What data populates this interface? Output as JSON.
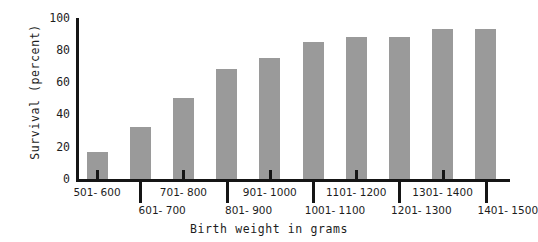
{
  "chart_data": {
    "type": "bar",
    "title": "",
    "xlabel": "Birth weight in grams",
    "ylabel": "Survival (percent)",
    "categories": [
      "501- 600",
      "601- 700",
      "701- 800",
      "801- 900",
      "901- 1000",
      "1001- 1100",
      "1101- 1200",
      "1201- 1300",
      "1301- 1400",
      "1401- 1500"
    ],
    "values": [
      17,
      32,
      50,
      68,
      75,
      85,
      88,
      88,
      93,
      93
    ],
    "ylim": [
      0,
      100
    ],
    "yticks": [
      0,
      20,
      40,
      60,
      80,
      100
    ],
    "ytick_labels": [
      "0",
      "20",
      "40",
      "60",
      "80",
      "100"
    ],
    "grid": false,
    "legend": false,
    "bar_color": "#9a9a9a",
    "axis_color": "#151515"
  }
}
